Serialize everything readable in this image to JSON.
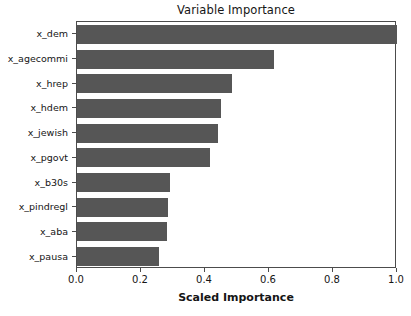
{
  "chart_data": {
    "type": "bar",
    "orientation": "horizontal",
    "title": "Variable Importance",
    "xlabel": "Scaled Importance",
    "ylabel": "",
    "categories": [
      "x_dem",
      "x_agecommi",
      "x_hrep",
      "x_hdem",
      "x_jewish",
      "x_pgovt",
      "x_b30s",
      "x_pindregl",
      "x_aba",
      "x_pausa"
    ],
    "values": [
      1.0,
      0.615,
      0.485,
      0.45,
      0.44,
      0.415,
      0.29,
      0.285,
      0.28,
      0.255
    ],
    "xlim": [
      0.0,
      1.0
    ],
    "xticks": [
      0.0,
      0.2,
      0.4,
      0.6,
      0.8,
      1.0
    ],
    "xtick_labels": [
      "0.0",
      "0.2",
      "0.4",
      "0.6",
      "0.8",
      "1.0"
    ],
    "grid": false,
    "legend": false,
    "bar_color": "#565656",
    "background_color": "#ffffff",
    "axis_color": "#4c4c4c"
  }
}
